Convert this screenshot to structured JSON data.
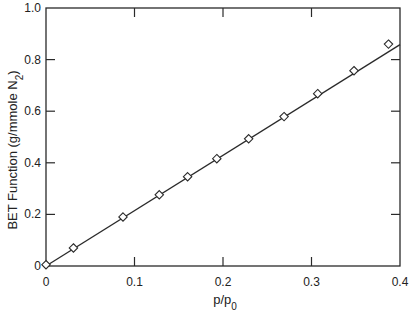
{
  "chart_data": {
    "type": "scatter",
    "title": "",
    "xlabel": "p/p0",
    "xlabel_main": "p/p",
    "xlabel_sub": "0",
    "ylabel": "BET Function (g/mmole N2)",
    "ylabel_main": "BET Function (g/mmole N",
    "ylabel_sub": "2",
    "ylabel_tail": ")",
    "xlim": [
      0,
      0.4
    ],
    "ylim": [
      0,
      1.0
    ],
    "x_ticks": [
      0,
      0.1,
      0.2,
      0.3,
      0.4
    ],
    "x_tick_labels": [
      "0",
      "0.1",
      "0.2",
      "0.3",
      "0.4"
    ],
    "y_ticks": [
      0,
      0.2,
      0.4,
      0.6,
      0.8,
      1.0
    ],
    "y_tick_labels": [
      "0",
      "0.2",
      "0.4",
      "0.6",
      "0.8",
      "1.0"
    ],
    "grid": false,
    "legend": null,
    "series": [
      {
        "name": "BET data",
        "marker": "diamond-open",
        "x": [
          0.0,
          0.031,
          0.087,
          0.128,
          0.16,
          0.193,
          0.229,
          0.269,
          0.307,
          0.348,
          0.387
        ],
        "y": [
          0.005,
          0.07,
          0.19,
          0.276,
          0.346,
          0.416,
          0.493,
          0.579,
          0.668,
          0.757,
          0.86
        ]
      },
      {
        "name": "Linear fit",
        "type": "line",
        "x": [
          0.0,
          0.4
        ],
        "y": [
          0.0,
          0.858
        ]
      }
    ],
    "colors": {
      "ink": "#2a2a2a",
      "background": "#ffffff"
    }
  }
}
